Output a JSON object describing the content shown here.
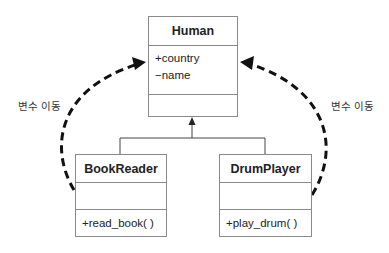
{
  "diagram": {
    "type": "UML class diagram",
    "classes": [
      {
        "name": "Human",
        "attributes": [
          "+country",
          "−name"
        ],
        "methods": []
      },
      {
        "name": "BookReader",
        "attributes": [],
        "methods": [
          "+read_book( )"
        ]
      },
      {
        "name": "DrumPlayer",
        "attributes": [],
        "methods": [
          "+play_drum( )"
        ]
      }
    ],
    "relations": [
      {
        "type": "generalization",
        "from": "BookReader",
        "to": "Human"
      },
      {
        "type": "generalization",
        "from": "DrumPlayer",
        "to": "Human"
      },
      {
        "type": "dashed-arrow",
        "from": "BookReader",
        "to": "Human",
        "label": "변수 이동"
      },
      {
        "type": "dashed-arrow",
        "from": "DrumPlayer",
        "to": "Human",
        "label": "변수 이동"
      }
    ],
    "labels": {
      "left": "변수 이동",
      "right": "변수 이동"
    },
    "colors": {
      "box_border": "#8a8a8a",
      "dashed_arrow": "#111111",
      "text": "#222222"
    }
  }
}
